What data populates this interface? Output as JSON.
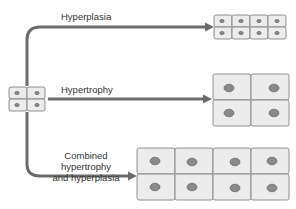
{
  "diagram": {
    "labels": {
      "hyperplasia": "Hyperplasia",
      "hypertrophy": "Hypertrophy",
      "combined_line1": "Combined hypertrophy",
      "combined_line2": "and hyperplasia"
    },
    "nodes": [
      {
        "id": "original",
        "description": "2x2 small cells"
      },
      {
        "id": "hyperplasia",
        "description": "2x4 small cells"
      },
      {
        "id": "hypertrophy",
        "description": "2x2 large cells"
      },
      {
        "id": "combined",
        "description": "2x4 large cells"
      }
    ],
    "edges": [
      {
        "from": "original",
        "to": "hyperplasia",
        "label": "Hyperplasia"
      },
      {
        "from": "original",
        "to": "hypertrophy",
        "label": "Hypertrophy"
      },
      {
        "from": "original",
        "to": "combined",
        "label": "Combined hypertrophy and hyperplasia"
      }
    ],
    "colors": {
      "arrow": "#6b6b6b",
      "cell_fill": "#ececec",
      "nucleus": "#8a8a8a"
    }
  }
}
